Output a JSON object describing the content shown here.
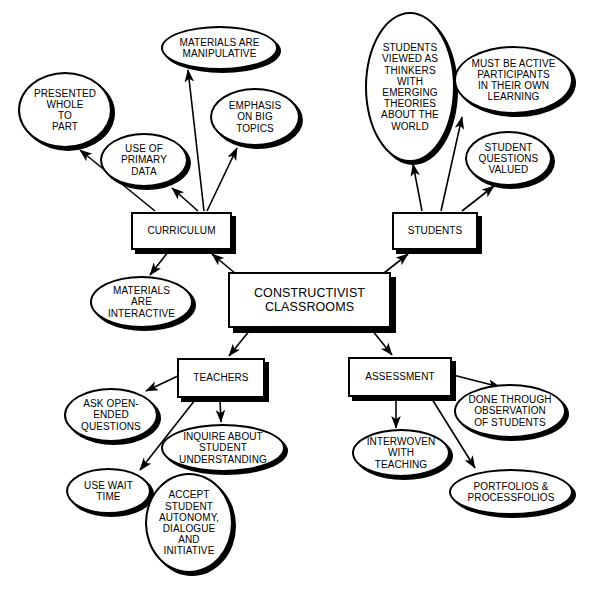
{
  "diagram": {
    "title": "CONSTRUCTIVIST CLASSROOMS",
    "type": "concept-map",
    "colors": {
      "background": "#ffffff",
      "stroke": "#000000",
      "fill": "#ffffff",
      "text": "#000000",
      "shadow": "#000000"
    },
    "nodes": [
      {
        "id": "central",
        "label": "CONSTRUCTIVIST\nCLASSROOMS",
        "shape": "box",
        "x": 228,
        "y": 272,
        "w": 163,
        "h": 56,
        "font_size": 12.5
      },
      {
        "id": "curriculum",
        "label": "CURRICULUM",
        "shape": "box",
        "x": 131,
        "y": 212,
        "w": 101,
        "h": 38,
        "font_size": 10
      },
      {
        "id": "students",
        "label": "STUDENTS",
        "shape": "box",
        "x": 392,
        "y": 212,
        "w": 86,
        "h": 38,
        "font_size": 10
      },
      {
        "id": "teachers",
        "label": "TEACHERS",
        "shape": "box",
        "x": 177,
        "y": 358,
        "w": 88,
        "h": 40,
        "font_size": 10
      },
      {
        "id": "assessment",
        "label": "ASSESSMENT",
        "shape": "box",
        "x": 348,
        "y": 357,
        "w": 104,
        "h": 40,
        "font_size": 10
      },
      {
        "id": "presented-whole-to-part",
        "label": "PRESENTED\nWHOLE\nTO\nPART",
        "shape": "ellipse",
        "x": 18,
        "y": 72,
        "w": 94,
        "h": 76,
        "font_size": 10
      },
      {
        "id": "materials-are-manipulative",
        "label": "MATERIALS ARE\nMANIPULATIVE",
        "shape": "ellipse",
        "x": 161,
        "y": 26,
        "w": 117,
        "h": 44,
        "font_size": 10
      },
      {
        "id": "emphasis-on-big-topics",
        "label": "EMPHASIS\nON BIG\nTOPICS",
        "shape": "ellipse",
        "x": 210,
        "y": 88,
        "w": 90,
        "h": 58,
        "font_size": 10
      },
      {
        "id": "use-of-primary-data",
        "label": "USE OF\nPRIMARY\nDATA",
        "shape": "ellipse",
        "x": 100,
        "y": 133,
        "w": 88,
        "h": 54,
        "font_size": 10
      },
      {
        "id": "materials-are-interactive",
        "label": "MATERIALS\nARE\nINTERACTIVE",
        "shape": "ellipse",
        "x": 90,
        "y": 276,
        "w": 103,
        "h": 52,
        "font_size": 10
      },
      {
        "id": "students-viewed-as-thinkers",
        "label": "STUDENTS\nVIEWED AS\nTHINKERS\nWITH\nEMERGING\nTHEORIES\nABOUT THE\nWORLD",
        "shape": "ellipse",
        "x": 365,
        "y": 12,
        "w": 90,
        "h": 150,
        "font_size": 10
      },
      {
        "id": "must-be-active-participants",
        "label": "MUST BE ACTIVE\nPARTICIPANTS\nIN THEIR OWN\nLEARNING",
        "shape": "ellipse",
        "x": 454,
        "y": 46,
        "w": 119,
        "h": 68,
        "font_size": 10
      },
      {
        "id": "student-questions-valued",
        "label": "STUDENT\nQUESTIONS\nVALUED",
        "shape": "ellipse",
        "x": 465,
        "y": 131,
        "w": 87,
        "h": 55,
        "font_size": 10
      },
      {
        "id": "ask-open-ended-questions",
        "label": "ASK OPEN-\nENDED\nQUESTIONS",
        "shape": "ellipse",
        "x": 64,
        "y": 388,
        "w": 94,
        "h": 54,
        "font_size": 10
      },
      {
        "id": "inquire-about-student-understanding",
        "label": "INQUIRE ABOUT\nSTUDENT\nUNDERSTANDING",
        "shape": "ellipse",
        "x": 161,
        "y": 424,
        "w": 124,
        "h": 48,
        "font_size": 10
      },
      {
        "id": "use-wait-time",
        "label": "USE WAIT\nTIME",
        "shape": "ellipse",
        "x": 66,
        "y": 468,
        "w": 85,
        "h": 46,
        "font_size": 10
      },
      {
        "id": "accept-student-autonomy",
        "label": "ACCEPT\nSTUDENT\nAUTONOMY,\nDIALOGUE\nAND\nINITIATIVE",
        "shape": "ellipse",
        "x": 145,
        "y": 473,
        "w": 88,
        "h": 100,
        "font_size": 10
      },
      {
        "id": "interwoven-with-teaching",
        "label": "INTERWOVEN\nWITH\nTEACHING",
        "shape": "ellipse",
        "x": 352,
        "y": 429,
        "w": 98,
        "h": 48,
        "font_size": 10
      },
      {
        "id": "done-through-observation",
        "label": "DONE THROUGH\nOBSERVATION\nOF STUDENTS",
        "shape": "ellipse",
        "x": 454,
        "y": 384,
        "w": 112,
        "h": 54,
        "font_size": 10
      },
      {
        "id": "portfolios-processfolios",
        "label": "PORTFOLIOS &\nPROCESSFOLIOS",
        "shape": "ellipse",
        "x": 449,
        "y": 469,
        "w": 124,
        "h": 46,
        "font_size": 10
      }
    ],
    "edges": [
      {
        "id": "central-to-curriculum",
        "from": "central",
        "to": "curriculum",
        "x1": 236,
        "y1": 274,
        "x2": 212,
        "y2": 254
      },
      {
        "id": "central-to-students",
        "from": "central",
        "to": "students",
        "x1": 384,
        "y1": 273,
        "x2": 408,
        "y2": 254
      },
      {
        "id": "central-to-teachers",
        "from": "central",
        "to": "teachers",
        "x1": 250,
        "y1": 330,
        "x2": 229,
        "y2": 356
      },
      {
        "id": "central-to-assessment",
        "from": "central",
        "to": "assessment",
        "x1": 372,
        "y1": 330,
        "x2": 392,
        "y2": 355
      },
      {
        "id": "curriculum-to-presented-whole",
        "from": "curriculum",
        "to": "presented-whole-to-part",
        "x1": 155,
        "y1": 211,
        "x2": 80,
        "y2": 150
      },
      {
        "id": "curriculum-to-use-of-primary-data",
        "from": "curriculum",
        "to": "use-of-primary-data",
        "x1": 198,
        "y1": 211,
        "x2": 172,
        "y2": 188
      },
      {
        "id": "curriculum-to-materials-manipulative",
        "from": "curriculum",
        "to": "materials-are-manipulative",
        "x1": 204,
        "y1": 211,
        "x2": 188,
        "y2": 70
      },
      {
        "id": "curriculum-to-emphasis-big-topics",
        "from": "curriculum",
        "to": "emphasis-on-big-topics",
        "x1": 207,
        "y1": 211,
        "x2": 237,
        "y2": 148
      },
      {
        "id": "curriculum-to-materials-interactive",
        "from": "curriculum",
        "to": "materials-are-interactive",
        "x1": 168,
        "y1": 252,
        "x2": 150,
        "y2": 275
      },
      {
        "id": "students-to-viewed-as-thinkers",
        "from": "students",
        "to": "students-viewed-as-thinkers",
        "x1": 422,
        "y1": 211,
        "x2": 413,
        "y2": 164
      },
      {
        "id": "students-to-must-be-active",
        "from": "students",
        "to": "must-be-active-participants",
        "x1": 441,
        "y1": 211,
        "x2": 462,
        "y2": 117
      },
      {
        "id": "students-to-student-questions-valued",
        "from": "students",
        "to": "student-questions-valued",
        "x1": 462,
        "y1": 211,
        "x2": 494,
        "y2": 186
      },
      {
        "id": "teachers-to-ask-open-ended",
        "from": "teachers",
        "to": "ask-open-ended-questions",
        "x1": 180,
        "y1": 375,
        "x2": 146,
        "y2": 391
      },
      {
        "id": "teachers-to-use-wait-time",
        "from": "teachers",
        "to": "use-wait-time",
        "x1": 195,
        "y1": 400,
        "x2": 140,
        "y2": 470
      },
      {
        "id": "teachers-to-inquire-about",
        "from": "teachers",
        "to": "inquire-about-student-understanding",
        "x1": 220,
        "y1": 400,
        "x2": 221,
        "y2": 422
      },
      {
        "id": "assessment-to-interwoven",
        "from": "assessment",
        "to": "interwoven-with-teaching",
        "x1": 396,
        "y1": 399,
        "x2": 396,
        "y2": 428
      },
      {
        "id": "assessment-to-done-through-observation",
        "from": "assessment",
        "to": "done-through-observation",
        "x1": 453,
        "y1": 375,
        "x2": 500,
        "y2": 387
      },
      {
        "id": "assessment-to-portfolios",
        "from": "assessment",
        "to": "portfolios-processfolios",
        "x1": 432,
        "y1": 399,
        "x2": 475,
        "y2": 468
      }
    ]
  }
}
